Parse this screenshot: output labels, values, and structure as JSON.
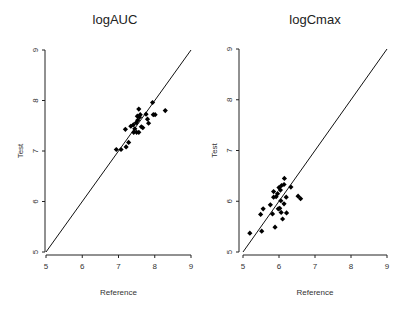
{
  "chart_data": [
    {
      "type": "scatter",
      "title": "logAUC",
      "xlabel": "Reference",
      "ylabel": "Test",
      "xlim": [
        5,
        9
      ],
      "ylim": [
        5,
        9
      ],
      "xticks": [
        "5",
        "6",
        "7",
        "8",
        "9"
      ],
      "yticks": [
        "5",
        "6",
        "7",
        "8",
        "9"
      ],
      "grid": false,
      "legend": null,
      "reference_line": {
        "label": "y = x",
        "from": [
          5,
          5
        ],
        "to": [
          9,
          9
        ]
      },
      "marker": "filled-diamond",
      "points": [
        [
          6.94,
          7.03
        ],
        [
          7.07,
          7.03
        ],
        [
          7.21,
          7.08
        ],
        [
          7.28,
          7.17
        ],
        [
          7.19,
          7.43
        ],
        [
          7.34,
          7.49
        ],
        [
          7.41,
          7.52
        ],
        [
          7.45,
          7.44
        ],
        [
          7.42,
          7.37
        ],
        [
          7.5,
          7.37
        ],
        [
          7.56,
          7.37
        ],
        [
          7.49,
          7.56
        ],
        [
          7.53,
          7.61
        ],
        [
          7.58,
          7.67
        ],
        [
          7.52,
          7.69
        ],
        [
          7.6,
          7.72
        ],
        [
          7.56,
          7.83
        ],
        [
          7.63,
          7.48
        ],
        [
          7.67,
          7.46
        ],
        [
          7.76,
          7.73
        ],
        [
          7.8,
          7.63
        ],
        [
          7.83,
          7.55
        ],
        [
          7.94,
          7.96
        ],
        [
          7.96,
          7.72
        ],
        [
          8.01,
          7.72
        ],
        [
          8.29,
          7.8
        ]
      ]
    },
    {
      "type": "scatter",
      "title": "logCmax",
      "xlabel": "Reference",
      "ylabel": "Test",
      "xlim": [
        5,
        9
      ],
      "ylim": [
        5,
        9
      ],
      "xticks": [
        "5",
        "6",
        "7",
        "8",
        "9"
      ],
      "yticks": [
        "5",
        "6",
        "7",
        "8",
        "9"
      ],
      "grid": false,
      "legend": null,
      "reference_line": {
        "label": "y = x",
        "from": [
          5,
          5
        ],
        "to": [
          9,
          9
        ]
      },
      "marker": "filled-diamond",
      "points": [
        [
          5.19,
          5.37
        ],
        [
          5.52,
          5.41
        ],
        [
          5.49,
          5.74
        ],
        [
          5.56,
          5.85
        ],
        [
          5.76,
          5.93
        ],
        [
          5.82,
          5.75
        ],
        [
          5.89,
          5.49
        ],
        [
          5.85,
          6.19
        ],
        [
          5.85,
          6.08
        ],
        [
          5.92,
          6.09
        ],
        [
          5.96,
          6.15
        ],
        [
          6.0,
          6.27
        ],
        [
          6.04,
          6.22
        ],
        [
          6.07,
          6.31
        ],
        [
          6.15,
          6.45
        ],
        [
          6.14,
          6.33
        ],
        [
          6.05,
          6.01
        ],
        [
          6.02,
          5.86
        ],
        [
          5.98,
          5.85
        ],
        [
          6.06,
          5.78
        ],
        [
          6.14,
          5.95
        ],
        [
          6.2,
          6.08
        ],
        [
          6.21,
          5.77
        ],
        [
          6.1,
          5.65
        ],
        [
          6.33,
          6.28
        ],
        [
          6.53,
          6.1
        ],
        [
          6.6,
          6.05
        ]
      ]
    }
  ],
  "colors": {
    "marker": "#000000",
    "axis": "#222222",
    "line": "#111111",
    "text": "#333333",
    "background": "#ffffff"
  }
}
